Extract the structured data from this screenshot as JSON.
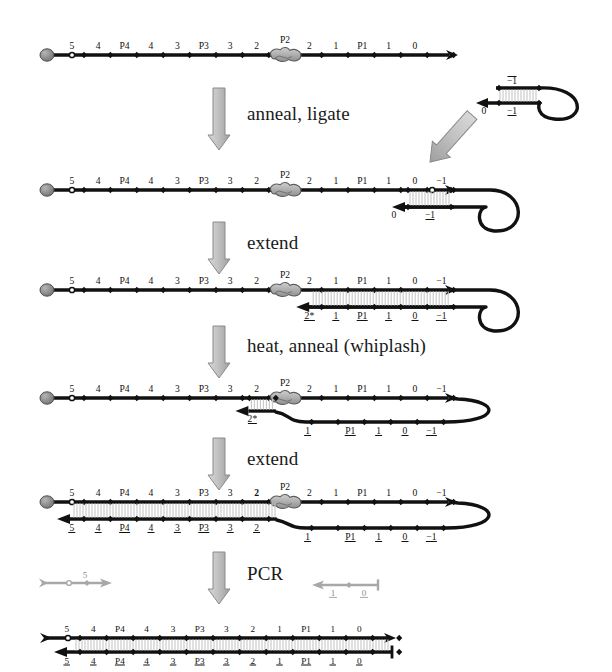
{
  "figure": {
    "colors": {
      "strand": "#111111",
      "probe_gray": "#9a9a9a",
      "arrow_gray": "#b9b9b9",
      "arrow_gray_edge": "#6e6e6e",
      "bead_gray": "#8c8c8c",
      "rung": "#c9c9c9",
      "background": "#ffffff"
    }
  },
  "steps": [
    {
      "id": "anneal-ligate",
      "label": "anneal, ligate"
    },
    {
      "id": "extend-1",
      "label": "extend"
    },
    {
      "id": "heat-anneal-whiplash",
      "label": "heat, anneal (whiplash)"
    },
    {
      "id": "extend-2",
      "label": "extend"
    },
    {
      "id": "pcr",
      "label": "PCR"
    }
  ],
  "rows": [
    {
      "id": "row-1-template",
      "caption": "initial template strand with P4, P3, P2, P1 probes",
      "top_labels": [
        "5",
        "4",
        "P4",
        "4",
        "3",
        "P3",
        "3",
        "2",
        "P2",
        "2",
        "1",
        "P1",
        "1",
        "0"
      ],
      "bottom_labels": [],
      "has_bead": true,
      "has_hollow_circle": true,
      "has_hairpin": false,
      "has_duplex": false
    },
    {
      "id": "row-2-ligated",
      "caption": "hairpin ligated to template 3' end",
      "top_labels": [
        "5",
        "4",
        "P4",
        "4",
        "3",
        "P3",
        "3",
        "2",
        "P2",
        "2",
        "1",
        "P1",
        "1",
        "0",
        "−1"
      ],
      "bottom_labels": [
        "0",
        "−1"
      ],
      "has_bead": true,
      "has_hollow_circle": true,
      "has_hairpin": true,
      "has_duplex": false
    },
    {
      "id": "row-3-extended",
      "caption": "polymerase extends hairpin primer leftward to 2*",
      "top_labels": [
        "5",
        "4",
        "P4",
        "4",
        "3",
        "P3",
        "3",
        "2",
        "P2",
        "2",
        "1",
        "P1",
        "1",
        "0",
        "−1"
      ],
      "bottom_labels": [
        "2*",
        "1",
        "P1",
        "1",
        "0",
        "−1"
      ],
      "has_bead": true,
      "has_hollow_circle": true,
      "has_hairpin": true,
      "has_duplex": true
    },
    {
      "id": "row-4-whiplash",
      "caption": "heat denature; 2* end re-anneals upstream of P2 (whiplash)",
      "top_labels": [
        "5",
        "4",
        "P4",
        "4",
        "3",
        "P3",
        "3",
        "2",
        "P2",
        "2",
        "1",
        "P1",
        "1",
        "0",
        "−1"
      ],
      "bottom_labels": [
        "2*",
        "1",
        "P1",
        "1",
        "0",
        "−1"
      ],
      "has_bead": true,
      "has_hollow_circle": true,
      "has_hairpin": true,
      "has_duplex": false
    },
    {
      "id": "row-5-extended-full",
      "caption": "extension of whiplash primer across the full template",
      "top_labels": [
        "5",
        "4",
        "P4",
        "4",
        "3",
        "P3",
        "3",
        "2",
        "P2",
        "2",
        "1",
        "P1",
        "1",
        "0",
        "−1"
      ],
      "bottom_labels": [
        "5",
        "4",
        "P4",
        "4",
        "3",
        "P3",
        "3",
        "2",
        "1",
        "P1",
        "1",
        "0",
        "−1"
      ],
      "has_bead": true,
      "has_hollow_circle": true,
      "has_hairpin": true,
      "has_duplex": true
    },
    {
      "id": "row-6-pcr-product",
      "caption": "final double-stranded PCR product",
      "top_labels": [
        "5",
        "4",
        "P4",
        "4",
        "3",
        "P3",
        "3",
        "2",
        "1",
        "P1",
        "1",
        "0"
      ],
      "bottom_labels": [
        "5",
        "4",
        "P4",
        "4",
        "3",
        "P3",
        "3",
        "2",
        "1",
        "P1",
        "1",
        "0"
      ],
      "has_bead": false,
      "has_hollow_circle": true,
      "has_hairpin": false,
      "has_duplex": true
    }
  ],
  "hairpin_probe": {
    "id": "hairpin-probe",
    "caption": "free hairpin probe added before ligation",
    "top_labels": [
      "−1"
    ],
    "bottom_labels": [
      "0",
      "−1"
    ]
  },
  "pcr_primers": [
    {
      "id": "pcr-primer-forward",
      "labels": [
        "5"
      ],
      "direction": "right"
    },
    {
      "id": "pcr-primer-reverse",
      "labels": [
        "1",
        "0"
      ],
      "direction": "left"
    }
  ]
}
